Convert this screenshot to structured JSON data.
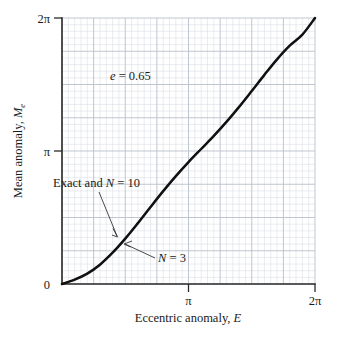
{
  "chart_data": {
    "type": "line",
    "title": "",
    "xlabel": "Eccentric anomaly, E",
    "ylabel": "Mean anomaly, M",
    "ylabel_sub": "e",
    "xlabel_var": "E",
    "xlim": [
      0,
      6.283185307
    ],
    "ylim": [
      0,
      6.283185307
    ],
    "grid": true,
    "grid_major_divisions": 8,
    "grid_minor_per_major": 5,
    "legend": "none",
    "xticks": [
      {
        "value": 0,
        "label": ""
      },
      {
        "value": 3.14159265,
        "label": "π"
      },
      {
        "value": 6.28318531,
        "label": "2π"
      }
    ],
    "yticks": [
      {
        "value": 0,
        "label": "0"
      },
      {
        "value": 3.14159265,
        "label": "π"
      },
      {
        "value": 6.28318531,
        "label": "2π"
      }
    ],
    "annotations": [
      {
        "id": "eccentricity",
        "text": "e = 0.65",
        "x": 1.6,
        "y": 5.0
      },
      {
        "id": "exact-and-n10",
        "text": "Exact and N = 10",
        "x": 0.45,
        "y": 2.45
      },
      {
        "id": "n-equals-3",
        "text": "N = 3",
        "x": 2.55,
        "y": 0.62
      }
    ],
    "parameters": {
      "eccentricity": 0.65,
      "N_low": 3,
      "N_high": 10
    },
    "series": [
      {
        "name": "Exact",
        "style": "solid-thick",
        "color": "#111111",
        "x": [
          0.0,
          0.31415927,
          0.62831853,
          0.9424778,
          1.25663706,
          1.57079633,
          1.88495559,
          2.19911486,
          2.51327412,
          2.82743339,
          3.14159265,
          3.45575192,
          3.76991118,
          4.08407045,
          4.39822972,
          4.71238898,
          5.02654825,
          5.34070751,
          5.65486678,
          5.96902604,
          6.28318531
        ],
        "y": [
          0.0,
          0.10327772,
          0.24620442,
          0.4566108,
          0.7384217,
          1.07079633,
          1.43770063,
          1.81913195,
          2.19338578,
          2.54924886,
          2.87979327,
          3.18874511,
          3.49769694,
          3.82824136,
          4.18410444,
          4.55835827,
          4.94007174,
          5.30677174,
          5.62878418,
          5.8900534,
          6.28318531
        ]
      },
      {
        "name": "N = 10",
        "style": "solid-thin-overlay",
        "color": "#5f6268",
        "x": [
          0.0,
          0.31415927,
          0.62831853,
          0.9424778,
          1.25663706,
          1.57079633,
          1.88495559,
          2.19911486,
          2.51327412,
          2.82743339,
          3.14159265,
          3.45575192,
          3.76991118,
          4.08407045,
          4.39822972,
          4.71238898,
          5.02654825,
          5.34070751,
          5.65486678,
          5.96902604,
          6.28318531
        ],
        "y": [
          0.0,
          0.10327772,
          0.24620442,
          0.4566108,
          0.7384217,
          1.07079633,
          1.43770063,
          1.81913195,
          2.19338578,
          2.54924886,
          2.87979327,
          3.18874511,
          3.49769694,
          3.82824136,
          4.18410444,
          4.55835827,
          4.94007174,
          5.30677174,
          5.62878418,
          5.8900534,
          6.28318531
        ]
      },
      {
        "name": "N = 3",
        "style": "solid-thin-overlay",
        "color": "#7d8087",
        "x": [
          0.0,
          0.31415927,
          0.62831853,
          0.9424778,
          1.25663706,
          1.57079633,
          1.88495559,
          2.19911486,
          2.51327412,
          2.82743339,
          3.14159265,
          3.45575192,
          3.76991118,
          4.08407045,
          4.39822972,
          4.71238898,
          5.02654825,
          5.34070751,
          5.65486678,
          5.96902604,
          6.28318531
        ],
        "y": [
          0.0,
          0.109,
          0.257,
          0.469,
          0.746,
          1.074,
          1.439,
          1.82,
          2.194,
          2.55,
          2.88,
          3.189,
          3.498,
          3.829,
          4.185,
          4.559,
          4.941,
          5.309,
          5.632,
          5.894,
          6.28318531
        ]
      }
    ]
  },
  "axes": {
    "y_title_main": "Mean anomaly, ",
    "y_title_var": "M",
    "y_title_sub": "e",
    "x_title_main": "Eccentric anomaly, ",
    "x_title_var": "E"
  },
  "labels": {
    "y_top": "2π",
    "y_mid": "π",
    "y_bottom": "0",
    "x_mid": "π",
    "x_right": "2π",
    "eccentricity_var": "e",
    "eccentricity_eq": " = 0.65",
    "exact_text": "Exact and ",
    "exact_var": "N",
    "exact_eq": " = 10",
    "n3_var": "N",
    "n3_eq": " = 3"
  },
  "colors": {
    "curve_exact": "#111111",
    "curve_n10": "#5f6268",
    "curve_n3": "#7d8087",
    "axis": "#2b2b2b",
    "grid_major": "#bdc3cc",
    "grid_minor": "#d9dde4",
    "background": "#ffffff"
  }
}
